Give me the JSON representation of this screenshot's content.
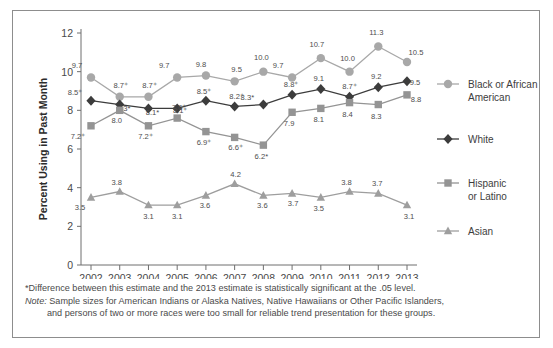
{
  "chart_data": {
    "type": "line",
    "title": "",
    "xlabel": "",
    "ylabel": "Percent Using in Past Month",
    "categories": [
      "2002",
      "2003",
      "2004",
      "2005",
      "2006",
      "2007",
      "2008",
      "2009",
      "2010",
      "2011",
      "2012",
      "2013"
    ],
    "ylim": [
      0,
      12
    ],
    "yticks": [
      "0",
      "2",
      "4",
      "6",
      "8",
      "10",
      "12"
    ],
    "grid": false,
    "legend_position": "right",
    "series": [
      {
        "name": "Black or African American",
        "marker": "circle",
        "color": "#a8a8a8",
        "values": [
          9.7,
          8.7,
          8.7,
          9.7,
          9.8,
          9.5,
          10.0,
          9.7,
          10.7,
          10.0,
          11.3,
          10.5
        ],
        "labels": [
          "9.7",
          "8.7⁺",
          "8.7⁺",
          "9.7",
          "9.8",
          "9.5",
          "10.0",
          "9.7",
          "10.7",
          "10.0",
          "11.3",
          "10.5"
        ]
      },
      {
        "name": "White",
        "marker": "diamond",
        "color": "#3c3c3c",
        "values": [
          8.5,
          8.3,
          8.1,
          8.1,
          8.5,
          8.2,
          8.3,
          8.8,
          9.1,
          8.7,
          9.2,
          9.5
        ],
        "labels": [
          "8.5⁺",
          "8.3*",
          "8.1*",
          "8.1⁺",
          "8.5⁺",
          "8.2⁺",
          "8.3*",
          "8.8⁺",
          "9.1",
          "8.7⁺",
          "9.2",
          "9.5"
        ]
      },
      {
        "name": "Hispanic or Latino",
        "marker": "square",
        "color": "#949494",
        "values": [
          7.2,
          8.0,
          7.2,
          7.6,
          6.9,
          6.6,
          6.2,
          7.9,
          8.1,
          8.4,
          8.3,
          8.8
        ],
        "labels": [
          "7.2⁺",
          "8.0",
          "7.2⁺",
          "7.6⁺",
          "6.9⁺",
          "6.6⁺",
          "6.2*",
          "7.9",
          "8.1",
          "8.4",
          "8.3",
          "8.8"
        ]
      },
      {
        "name": "Asian",
        "marker": "triangle",
        "color": "#9e9e9e",
        "values": [
          3.5,
          3.8,
          3.1,
          3.1,
          3.6,
          4.2,
          3.6,
          3.7,
          3.5,
          3.8,
          3.7,
          3.1
        ],
        "labels": [
          "3.5",
          "3.8",
          "3.1",
          "3.1",
          "3.6",
          "4.2",
          "3.6",
          "3.7",
          "3.5",
          "3.8",
          "3.7",
          "3.1"
        ]
      }
    ]
  },
  "legend": {
    "items": [
      {
        "label_line1": "Black or African",
        "label_line2": "American"
      },
      {
        "label_line1": "White",
        "label_line2": ""
      },
      {
        "label_line1": "Hispanic",
        "label_line2": "or Latino"
      },
      {
        "label_line1": "Asian",
        "label_line2": ""
      }
    ]
  },
  "footnotes": {
    "significance": "*Difference between this estimate and the 2013 estimate is statistically significant at the .05 level.",
    "note_label": "Note:",
    "note_line1": " Sample sizes for American Indians or Alaska Natives, Native Hawaiians or Other Pacific Islanders,",
    "note_line2": "and persons of two or more races were too small for reliable trend presentation for these groups."
  }
}
